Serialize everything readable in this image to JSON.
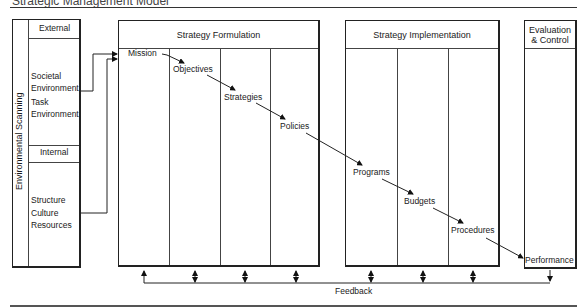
{
  "title": "Strategic Management Model",
  "environmental_scanning": {
    "label": "Environmental Scanning",
    "external": {
      "header": "External",
      "items": [
        "Societal",
        "Environment",
        "Task",
        "Environment"
      ]
    },
    "internal": {
      "header": "Internal",
      "items": [
        "Structure",
        "Culture",
        "Resources"
      ]
    }
  },
  "strategy_formulation": {
    "header": "Strategy Formulation",
    "steps": [
      "Mission",
      "Objectives",
      "Strategies",
      "Policies"
    ]
  },
  "strategy_implementation": {
    "header": "Strategy Implementation",
    "steps": [
      "Programs",
      "Budgets",
      "Procedures"
    ]
  },
  "evaluation_control": {
    "header_line1": "Evaluation",
    "header_line2": "& Control",
    "steps": [
      "Performance"
    ]
  },
  "feedback": {
    "label": "Feedback"
  }
}
